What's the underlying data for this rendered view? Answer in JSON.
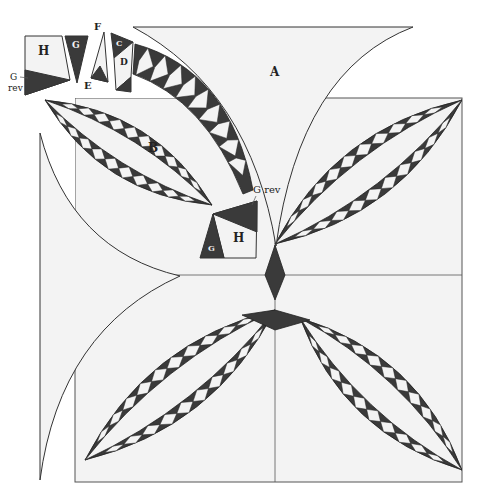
{
  "colors": {
    "background": "#ffffff",
    "light_fabric": "#f3f3f3",
    "dark_fabric": "#3a3a3a",
    "outline": "#333333"
  },
  "labels": {
    "A": "A",
    "B": "B",
    "C": "C",
    "D": "D",
    "E": "E",
    "F": "F",
    "G_top": "G",
    "G_bottom": "G",
    "H_top": "H",
    "H_bottom": "H",
    "G_rev_left_line1": "G",
    "G_rev_left_line2": "rev",
    "G_rev_right": "G rev"
  },
  "pieces": [
    {
      "id": "A",
      "name": "Background corner piece",
      "fabric": "light"
    },
    {
      "id": "B",
      "name": "Melon center",
      "fabric": "light"
    },
    {
      "id": "C",
      "name": "Arc end triangle",
      "fabric": "dark"
    },
    {
      "id": "D",
      "name": "Arc diamond",
      "fabric": "light"
    },
    {
      "id": "E",
      "name": "Arc end point",
      "fabric": "dark"
    },
    {
      "id": "F",
      "name": "Arc end wedge",
      "fabric": "light"
    },
    {
      "id": "G",
      "name": "Corner square triangle",
      "fabric": "dark"
    },
    {
      "id": "G rev",
      "name": "Corner square triangle reversed",
      "fabric": "dark"
    },
    {
      "id": "H",
      "name": "Corner square",
      "fabric": "light"
    }
  ],
  "arc": {
    "diamonds_per_side": 10
  }
}
